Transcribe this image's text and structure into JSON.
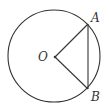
{
  "diagram": {
    "type": "geometry",
    "stroke_color": "#333333",
    "circle": {
      "cx": 54,
      "cy": 56,
      "r": 46
    },
    "points": {
      "O": {
        "label": "O",
        "x": 55,
        "y": 57
      },
      "A": {
        "label": "A",
        "x": 88,
        "y": 24
      },
      "B": {
        "label": "B",
        "x": 88,
        "y": 89
      }
    },
    "segments": [
      [
        "O",
        "A"
      ],
      [
        "O",
        "B"
      ],
      [
        "A",
        "B"
      ]
    ]
  }
}
